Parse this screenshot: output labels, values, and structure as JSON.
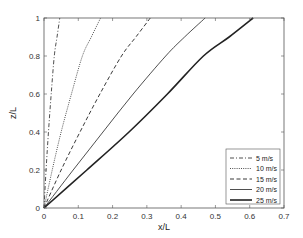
{
  "chart_data": {
    "type": "line",
    "title": "",
    "xlabel": "x/L",
    "ylabel": "z/L",
    "xlim": [
      0,
      0.7
    ],
    "ylim": [
      0,
      1
    ],
    "xticks": [
      "0",
      "0.1",
      "0.2",
      "0.3",
      "0.4",
      "0.5",
      "0.6",
      "0.7"
    ],
    "yticks": [
      "0",
      "0.2",
      "0.4",
      "0.6",
      "0.8",
      "1"
    ],
    "grid": false,
    "legend_position": "lower right",
    "series": [
      {
        "name": "5 m/s",
        "style": "dash-dot",
        "width": 0.8,
        "x": [
          0,
          0.006,
          0.013,
          0.021,
          0.03,
          0.038,
          0.046
        ],
        "y": [
          0,
          0.2,
          0.4,
          0.6,
          0.8,
          0.9,
          1.0
        ]
      },
      {
        "name": "10 m/s",
        "style": "dotted",
        "width": 0.8,
        "x": [
          0,
          0.024,
          0.05,
          0.08,
          0.112,
          0.138,
          0.165
        ],
        "y": [
          0,
          0.2,
          0.4,
          0.6,
          0.8,
          0.9,
          1.0
        ]
      },
      {
        "name": "15 m/s",
        "style": "dashed",
        "width": 0.9,
        "x": [
          0,
          0.05,
          0.105,
          0.163,
          0.226,
          0.268,
          0.31
        ],
        "y": [
          0,
          0.2,
          0.4,
          0.6,
          0.8,
          0.9,
          1.0
        ]
      },
      {
        "name": "20 m/s",
        "style": "solid",
        "width": 0.8,
        "x": [
          0,
          0.085,
          0.172,
          0.26,
          0.355,
          0.41,
          0.47
        ],
        "y": [
          0,
          0.2,
          0.4,
          0.6,
          0.8,
          0.9,
          1.0
        ]
      },
      {
        "name": "25 m/s",
        "style": "solid",
        "width": 1.6,
        "x": [
          0,
          0.125,
          0.248,
          0.36,
          0.465,
          0.54,
          0.61
        ],
        "y": [
          0,
          0.2,
          0.4,
          0.6,
          0.8,
          0.9,
          1.0
        ]
      }
    ]
  },
  "legend": {
    "items": [
      "5 m/s",
      "10 m/s",
      "15 m/s",
      "20 m/s",
      "25 m/s"
    ]
  },
  "axes": {
    "xlabel": "x/L",
    "ylabel": "z/L"
  }
}
